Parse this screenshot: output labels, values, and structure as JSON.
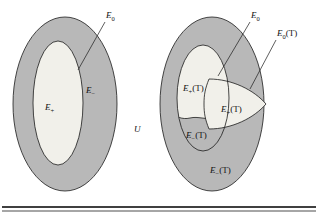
{
  "figure": {
    "caption_rule_present": true,
    "background_color": "#ffffff",
    "colors": {
      "gray_fill": "#b8b8b8",
      "light_fill": "#f1f0ea",
      "outline": "#1a1a1a",
      "text": "#111111",
      "rule": "#000000"
    }
  },
  "universe": {
    "label_base": "U",
    "label_full": "U"
  },
  "left_diagram": {
    "name": "unperturbed-splitting",
    "outer_region": {
      "label_base": "E",
      "label_sub": "−",
      "label_full": "E−",
      "fill": "#b8b8b8"
    },
    "inner_region": {
      "label_base": "E",
      "label_sub": "+",
      "label_full": "E+",
      "fill": "#f1f0ea"
    },
    "boundary": {
      "label_base": "E",
      "label_sub": "0",
      "label_full": "E0",
      "leader": true
    }
  },
  "right_diagram": {
    "name": "perturbed-splitting",
    "outer_region": {
      "label_base": "E",
      "label_sub": "−",
      "label_arg": "(T)",
      "label_full": "E−(T)",
      "fill": "#b8b8b8"
    },
    "inner_light_region": {
      "label_base": "E",
      "label_sub": "+",
      "label_arg": "(T)",
      "label_full": "E+(T)",
      "fill": "#f1f0ea"
    },
    "lens_region": {
      "label_base": "E",
      "label_sub": "+",
      "label_arg": "(T)",
      "label_full": "E+(T)",
      "fill": "#f1f0ea"
    },
    "inner_gray_region": {
      "label_base": "E",
      "label_sub": "−",
      "label_arg": "(T)",
      "label_full": "E−(T)",
      "fill": "#b8b8b8"
    },
    "boundary_unperturbed": {
      "label_base": "E",
      "label_sub": "0",
      "label_full": "E0",
      "leader": true
    },
    "boundary_perturbed": {
      "label_base": "E",
      "label_sub": "0",
      "label_arg": "(T)",
      "label_full": "E0(T)",
      "leader": true
    }
  }
}
